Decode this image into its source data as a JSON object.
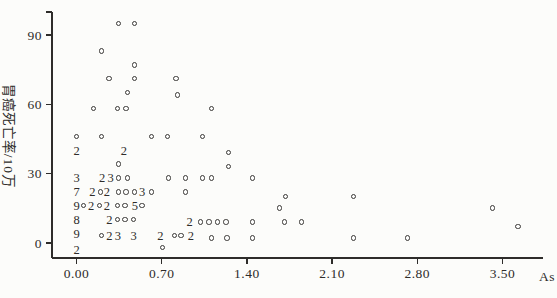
{
  "figure": {
    "background": "#fcfcfa",
    "axis_color": "#2e2c2a",
    "text_color": "#2e2c2a",
    "marker_color": "#3a3836"
  },
  "chart_data": {
    "type": "scatter",
    "title": "",
    "xlabel": "As",
    "ylabel": "胃癌死亡率/10万",
    "xlim": [
      0,
      3.8
    ],
    "ylim": [
      -5,
      105
    ],
    "grid": false,
    "legend": "none",
    "marker": "open-circle",
    "x_ticks": [
      0.0,
      0.7,
      1.4,
      2.1,
      2.8,
      3.5
    ],
    "x_tick_labels": [
      "0.00",
      "0.70",
      "1.40",
      "2.10",
      "2.80",
      "3.50"
    ],
    "y_ticks": [
      0,
      30,
      60,
      90
    ],
    "y_tick_labels": [
      "0",
      "30",
      "60",
      "90"
    ],
    "points": [
      {
        "x": 0.35,
        "y": 95
      },
      {
        "x": 0.48,
        "y": 95
      },
      {
        "x": 0.21,
        "y": 83
      },
      {
        "x": 0.48,
        "y": 77
      },
      {
        "x": 0.27,
        "y": 71
      },
      {
        "x": 0.48,
        "y": 71
      },
      {
        "x": 0.82,
        "y": 71
      },
      {
        "x": 0.42,
        "y": 65
      },
      {
        "x": 0.83,
        "y": 64
      },
      {
        "x": 0.14,
        "y": 58
      },
      {
        "x": 0.34,
        "y": 58
      },
      {
        "x": 0.41,
        "y": 58
      },
      {
        "x": 1.11,
        "y": 58
      },
      {
        "x": 0.0,
        "y": 46
      },
      {
        "x": 0.21,
        "y": 46
      },
      {
        "x": 0.62,
        "y": 46
      },
      {
        "x": 0.75,
        "y": 46
      },
      {
        "x": 1.04,
        "y": 46
      },
      {
        "x": 1.25,
        "y": 39
      },
      {
        "x": 0.35,
        "y": 34
      },
      {
        "x": 1.25,
        "y": 33
      },
      {
        "x": 0.35,
        "y": 28
      },
      {
        "x": 0.42,
        "y": 28
      },
      {
        "x": 0.76,
        "y": 28
      },
      {
        "x": 0.9,
        "y": 28
      },
      {
        "x": 1.04,
        "y": 28
      },
      {
        "x": 1.11,
        "y": 28
      },
      {
        "x": 1.45,
        "y": 28
      },
      {
        "x": 0.2,
        "y": 22
      },
      {
        "x": 0.35,
        "y": 22
      },
      {
        "x": 0.41,
        "y": 22
      },
      {
        "x": 0.48,
        "y": 22
      },
      {
        "x": 0.62,
        "y": 22
      },
      {
        "x": 0.9,
        "y": 22
      },
      {
        "x": 1.72,
        "y": 20
      },
      {
        "x": 2.28,
        "y": 20
      },
      {
        "x": 0.06,
        "y": 16
      },
      {
        "x": 0.19,
        "y": 16
      },
      {
        "x": 0.34,
        "y": 16
      },
      {
        "x": 0.4,
        "y": 16
      },
      {
        "x": 0.54,
        "y": 16
      },
      {
        "x": 1.67,
        "y": 15
      },
      {
        "x": 3.42,
        "y": 15
      },
      {
        "x": 0.34,
        "y": 10
      },
      {
        "x": 0.4,
        "y": 10
      },
      {
        "x": 0.47,
        "y": 10
      },
      {
        "x": 1.02,
        "y": 9
      },
      {
        "x": 1.09,
        "y": 9
      },
      {
        "x": 1.16,
        "y": 9
      },
      {
        "x": 1.23,
        "y": 9
      },
      {
        "x": 1.45,
        "y": 9
      },
      {
        "x": 1.71,
        "y": 9
      },
      {
        "x": 1.85,
        "y": 9
      },
      {
        "x": 3.63,
        "y": 7
      },
      {
        "x": 0.21,
        "y": 3
      },
      {
        "x": 0.81,
        "y": 3
      },
      {
        "x": 0.86,
        "y": 3
      },
      {
        "x": 1.11,
        "y": 2
      },
      {
        "x": 1.24,
        "y": 2
      },
      {
        "x": 1.45,
        "y": 2
      },
      {
        "x": 2.28,
        "y": 2
      },
      {
        "x": 2.72,
        "y": 2
      },
      {
        "x": 0.71,
        "y": -2
      }
    ],
    "overlap_count_labels": [
      {
        "n": "2",
        "x": 0.0,
        "y": 40
      },
      {
        "n": "2",
        "x": 0.39,
        "y": 40
      },
      {
        "n": "3",
        "x": 0.0,
        "y": 28
      },
      {
        "n": "2",
        "x": 0.21,
        "y": 28
      },
      {
        "n": "3",
        "x": 0.28,
        "y": 28
      },
      {
        "n": "7",
        "x": 0.0,
        "y": 22
      },
      {
        "n": "2",
        "x": 0.13,
        "y": 22
      },
      {
        "n": "2",
        "x": 0.25,
        "y": 22
      },
      {
        "n": "3",
        "x": 0.54,
        "y": 22
      },
      {
        "n": "9",
        "x": 0.0,
        "y": 16
      },
      {
        "n": "2",
        "x": 0.12,
        "y": 16
      },
      {
        "n": "2",
        "x": 0.25,
        "y": 16
      },
      {
        "n": "5",
        "x": 0.48,
        "y": 16
      },
      {
        "n": "8",
        "x": 0.0,
        "y": 10
      },
      {
        "n": "2",
        "x": 0.27,
        "y": 10
      },
      {
        "n": "2",
        "x": 0.93,
        "y": 9
      },
      {
        "n": "9",
        "x": 0.0,
        "y": 4
      },
      {
        "n": "2",
        "x": 0.27,
        "y": 3
      },
      {
        "n": "3",
        "x": 0.34,
        "y": 3
      },
      {
        "n": "3",
        "x": 0.47,
        "y": 3
      },
      {
        "n": "2",
        "x": 0.69,
        "y": 3
      },
      {
        "n": "2",
        "x": 0.94,
        "y": 3
      },
      {
        "n": "2",
        "x": 0.0,
        "y": -3
      }
    ]
  }
}
